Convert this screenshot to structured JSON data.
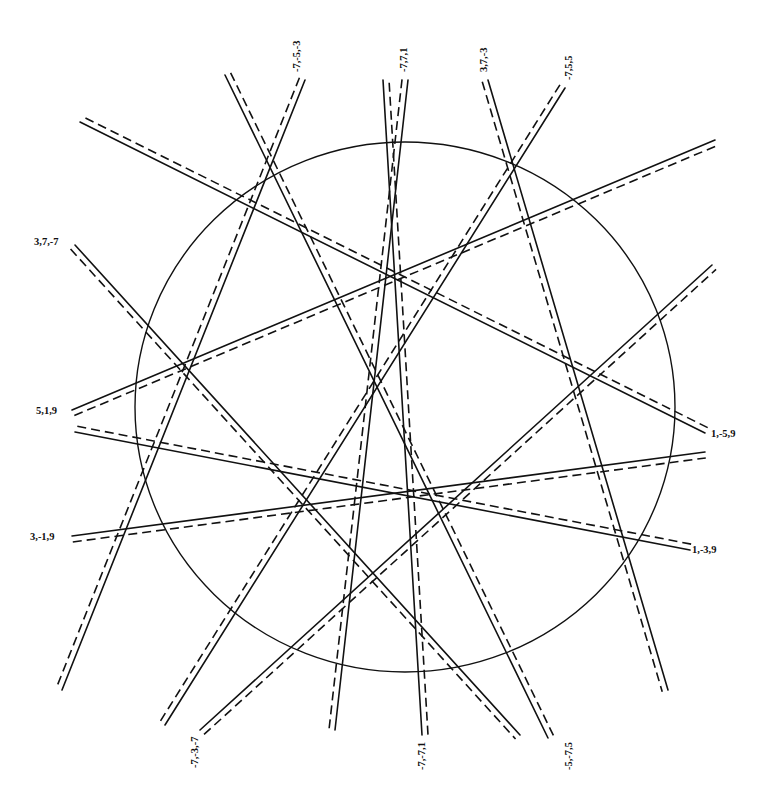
{
  "diagram": {
    "title": "",
    "circle": {
      "cx": 405,
      "cy": 407,
      "rx": 270,
      "ry": 265
    },
    "dash_offset_px": 6,
    "lines": [
      {
        "label": "-7,-5,-3",
        "x1": 305,
        "y1": 80,
        "x2": 62,
        "y2": 690,
        "label_x": 300,
        "label_y": 72,
        "label_rotate": -90
      },
      {
        "label": "-5,-7,5",
        "x1": 548,
        "y1": 738,
        "x2": 225,
        "y2": 75,
        "label_x": 572,
        "label_y": 770,
        "label_rotate": -90
      },
      {
        "label": "-7,7,1",
        "x1": 408,
        "y1": 80,
        "x2": 335,
        "y2": 730,
        "label_x": 407,
        "label_y": 72,
        "label_rotate": -90
      },
      {
        "label": "-7,-7,1",
        "x1": 422,
        "y1": 735,
        "x2": 383,
        "y2": 80,
        "label_x": 425,
        "label_y": 770,
        "label_rotate": -90
      },
      {
        "label": "3,7,-3",
        "x1": 488,
        "y1": 80,
        "x2": 668,
        "y2": 690,
        "label_x": 487,
        "label_y": 72,
        "label_rotate": -90
      },
      {
        "label": "-7,5,5",
        "x1": 565,
        "y1": 88,
        "x2": 165,
        "y2": 725,
        "label_x": 572,
        "label_y": 80,
        "label_rotate": -90
      },
      {
        "label": "-7,-3,-7",
        "x1": 200,
        "y1": 730,
        "x2": 712,
        "y2": 265,
        "label_x": 198,
        "label_y": 768,
        "label_rotate": -90
      },
      {
        "label": "3,7,-7",
        "x1": 75,
        "y1": 245,
        "x2": 520,
        "y2": 735,
        "label_x": 34,
        "label_y": 245,
        "label_rotate": 0
      },
      {
        "label": "5,1,9",
        "x1": 72,
        "y1": 410,
        "x2": 715,
        "y2": 140,
        "label_x": 36,
        "label_y": 414,
        "label_rotate": 0
      },
      {
        "label": "1,-5,9",
        "x1": 705,
        "y1": 433,
        "x2": 80,
        "y2": 122,
        "label_x": 711,
        "label_y": 437,
        "label_rotate": 0
      },
      {
        "label": "3,-1,9",
        "x1": 72,
        "y1": 536,
        "x2": 705,
        "y2": 452,
        "label_x": 30,
        "label_y": 540,
        "label_rotate": 0
      },
      {
        "label": "1,-3,9",
        "x1": 690,
        "y1": 550,
        "x2": 75,
        "y2": 432,
        "label_x": 692,
        "label_y": 553,
        "label_rotate": 0
      }
    ]
  }
}
